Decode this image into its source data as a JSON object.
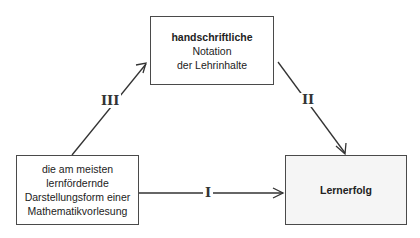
{
  "diagram": {
    "boxes": {
      "top": {
        "line1": "handschriftliche",
        "line2": "Notation",
        "line3": "der Lehrinhalte"
      },
      "left": {
        "line1": "die am meisten",
        "line2": "lernfördernde",
        "line3": "Darstellungsform einer",
        "line4": "Mathematikvorlesung"
      },
      "right": {
        "line1": "Lernerfolg"
      }
    },
    "arrows": {
      "I": "I",
      "II": "II",
      "III": "III"
    }
  }
}
